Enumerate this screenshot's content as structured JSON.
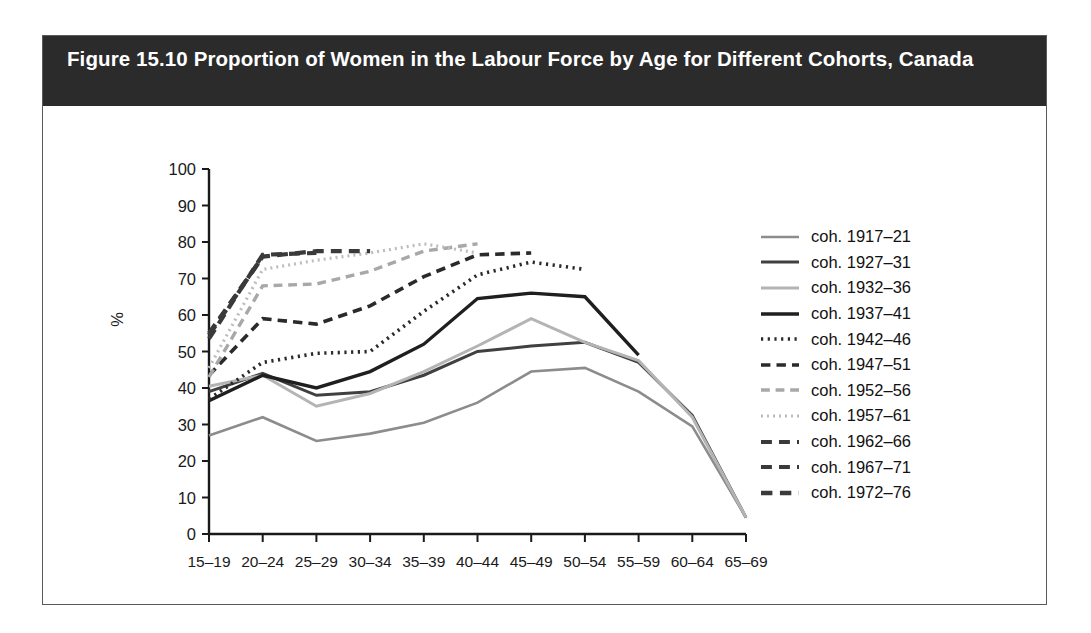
{
  "figure": {
    "title": "Figure 15.10 Proportion of Women in the Labour Force by Age for Different Cohorts, Canada"
  },
  "colors": {
    "title_bar_bg": "#2b2b2b",
    "title_text": "#ffffff",
    "border": "#5a5a5a",
    "axis": "#1a1a1a",
    "plot_bg": "#ffffff"
  },
  "chart_data": {
    "type": "line",
    "title": "Figure 15.10 Proportion of Women in the Labour Force by Age for Different Cohorts, Canada",
    "xlabel": "",
    "ylabel": "%",
    "ylim": [
      0,
      100
    ],
    "yticks": [
      0,
      10,
      20,
      30,
      40,
      50,
      60,
      70,
      80,
      90,
      100
    ],
    "categories": [
      "15–19",
      "20–24",
      "25–29",
      "30–34",
      "35–39",
      "40–44",
      "45–49",
      "50–54",
      "55–59",
      "60–64",
      "65–69"
    ],
    "grid": false,
    "legend_position": "right",
    "series": [
      {
        "name": "coh. 1917–21",
        "label": "coh. 1917–21",
        "style": "solid",
        "color": "#8c8c8c",
        "width": 2.6,
        "values": [
          27.0,
          32.0,
          25.5,
          27.5,
          30.5,
          36.0,
          44.5,
          45.5,
          39.0,
          29.5,
          4.5
        ]
      },
      {
        "name": "coh. 1927–31",
        "label": "coh. 1927–31",
        "style": "solid",
        "color": "#404040",
        "width": 3.0,
        "values": [
          39.0,
          44.0,
          38.0,
          39.0,
          43.5,
          50.0,
          51.5,
          52.5,
          47.0,
          32.5,
          4.5
        ]
      },
      {
        "name": "coh. 1932–36",
        "label": "coh. 1932–36",
        "style": "solid",
        "color": "#b4b4b4",
        "width": 3.0,
        "values": [
          40.5,
          43.5,
          35.0,
          38.5,
          44.5,
          51.5,
          59.0,
          52.5,
          47.5,
          32.0,
          4.5
        ]
      },
      {
        "name": "coh. 1937–41",
        "label": "coh. 1937–41",
        "style": "solid",
        "color": "#1f1f1f",
        "width": 3.4,
        "values": [
          36.5,
          43.5,
          40.0,
          44.5,
          52.0,
          64.5,
          66.0,
          65.0,
          49.0,
          null,
          null
        ]
      },
      {
        "name": "coh. 1942–46",
        "label": "coh. 1942–46",
        "style": "dotted",
        "color": "#2a2a2a",
        "width": 3.6,
        "values": [
          37.0,
          47.0,
          49.5,
          50.0,
          61.0,
          71.0,
          74.5,
          72.5,
          null,
          null,
          null
        ]
      },
      {
        "name": "coh. 1947–51",
        "label": "coh. 1947–51",
        "style": "dashed",
        "color": "#2a2a2a",
        "width": 3.6,
        "values": [
          43.5,
          59.0,
          57.5,
          62.5,
          70.5,
          76.5,
          77.0,
          null,
          null,
          null,
          null
        ]
      },
      {
        "name": "coh. 1952–56",
        "label": "coh. 1952–56",
        "style": "dashed",
        "color": "#a8a8a8",
        "width": 3.4,
        "values": [
          43.0,
          68.0,
          68.5,
          72.0,
          77.5,
          79.5,
          null,
          null,
          null,
          null,
          null
        ]
      },
      {
        "name": "coh. 1957–61",
        "label": "coh. 1957–61",
        "style": "dotted",
        "color": "#bdbdbd",
        "width": 3.2,
        "values": [
          45.5,
          72.5,
          75.0,
          77.0,
          79.5,
          77.0,
          null,
          null,
          null,
          null,
          null
        ]
      },
      {
        "name": "coh. 1962–66",
        "label": "coh. 1962–66",
        "style": "dashed",
        "color": "#3a3a3a",
        "width": 4.2,
        "values": [
          55.0,
          76.0,
          77.5,
          77.5,
          null,
          null,
          null,
          null,
          null,
          null,
          null
        ]
      },
      {
        "name": "coh. 1967–71",
        "label": "coh. 1967–71",
        "style": "dashed",
        "color": "#3a3a3a",
        "width": 4.2,
        "values": [
          53.5,
          76.5,
          77.0,
          null,
          null,
          null,
          null,
          null,
          null,
          null,
          null
        ]
      },
      {
        "name": "coh. 1972–76",
        "label": "coh. 1972–76",
        "style": "dashed",
        "color": "#3a3a3a",
        "width": 4.4,
        "values": [
          54.5,
          76.0,
          null,
          null,
          null,
          null,
          null,
          null,
          null,
          null,
          null
        ]
      }
    ]
  }
}
